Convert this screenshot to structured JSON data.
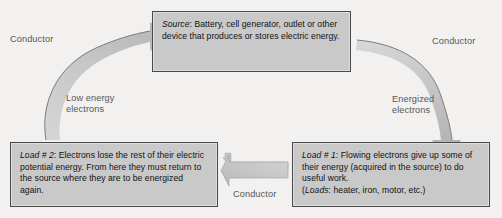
{
  "diagram": {
    "background_color": "#f2f1ef",
    "box_fill_color": "#c9c9c9",
    "box_border_color": "#4a4a4a",
    "arrow_color": "#bdbdbd",
    "label_color": "#575757"
  },
  "boxes": {
    "source": {
      "lead": "Source:",
      "text": "Source: Battery, cell generator, outlet or other device that produces or stores electric energy."
    },
    "load2": {
      "lead": "Load # 2:",
      "text": "Load # 2: Electrons lose the rest of their electric potential energy.  From here they must return to the source where they are to be energized again."
    },
    "load1": {
      "lead": "Load # 1:",
      "text": "Load # 1: Flowing electrons give up some of their energy (acquired in the source) to do useful work.\n(Loads: heater, iron, motor, etc.)"
    }
  },
  "labels": {
    "conductor_left": "Conductor",
    "conductor_right": "Conductor",
    "conductor_bottom": "Conductor",
    "low_energy_electrons": "Low energy\nelectrons",
    "energized_electrons": "Energized\nelectrons"
  },
  "arrows": {
    "left_curve": {
      "name": "low-energy-electrons-arrow",
      "from": "load2",
      "to": "source",
      "direction": "up-right"
    },
    "right_curve": {
      "name": "energized-electrons-arrow",
      "from": "source",
      "to": "load1",
      "direction": "down"
    },
    "bottom_straight": {
      "name": "conductor-arrow",
      "from": "load1",
      "to": "load2",
      "direction": "left"
    }
  }
}
